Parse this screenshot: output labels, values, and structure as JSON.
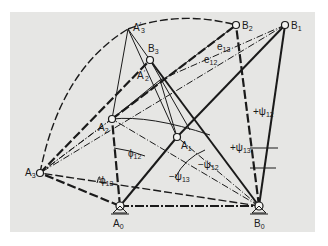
{
  "figure": {
    "background": "#e6e6e4",
    "line_color": "#1a1a1a"
  },
  "points": {
    "A0": {
      "label": "A",
      "sub": "0",
      "x": 120,
      "y": 206
    },
    "B0": {
      "label": "B",
      "sub": "0",
      "x": 259,
      "y": 206
    },
    "A1": {
      "label": "A",
      "sub": "1",
      "x": 177,
      "y": 137
    },
    "A2": {
      "label": "A",
      "sub": "2",
      "x": 112,
      "y": 119
    },
    "A3": {
      "label": "A",
      "sub": "3",
      "x": 40,
      "y": 173
    },
    "B1": {
      "label": "B",
      "sub": "1",
      "x": 285,
      "y": 25
    },
    "B2": {
      "label": "B",
      "sub": "2",
      "x": 236,
      "y": 25
    },
    "B3": {
      "label": "B",
      "sub": "3",
      "x": 150,
      "y": 60
    },
    "A2p": {
      "label": "A",
      "sub": "2",
      "prime": "′",
      "x": 160,
      "y": 80
    },
    "A3p": {
      "label": "A",
      "sub": "3",
      "prime": "′",
      "x": 128,
      "y": 29
    }
  },
  "angles": {
    "e13": {
      "label": "e",
      "sub": "13"
    },
    "e12": {
      "label": "e",
      "sub": "12"
    },
    "phi12": {
      "label": "ϕ",
      "sub": "12"
    },
    "phi13": {
      "label": "ϕ",
      "sub": "13"
    },
    "psi12_pos": {
      "label": "+ψ",
      "sub": "12"
    },
    "psi13_pos": {
      "label": "+ψ",
      "sub": "13"
    },
    "psi12_neg": {
      "label": "−ψ",
      "sub": "12"
    },
    "psi13_neg": {
      "label": "−ψ",
      "sub": "13"
    }
  }
}
